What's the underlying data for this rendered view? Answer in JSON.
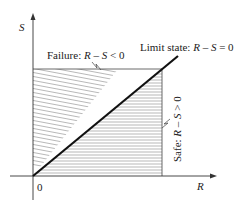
{
  "diagram": {
    "axes": {
      "y_label": "S",
      "x_label": "R",
      "origin_label": "0"
    },
    "regions": {
      "failure": {
        "prefix": "Failure: ",
        "expr_r": "R",
        "expr_rest": " – ",
        "expr_s": "S",
        "expr_tail": " < 0"
      },
      "safe": {
        "prefix": "Safe: ",
        "expr_r": "R",
        "expr_rest": " – ",
        "expr_s": "S",
        "expr_tail": " > 0"
      }
    },
    "limit_state": {
      "prefix": "Limit state: ",
      "expr_r": "R",
      "expr_rest": " – ",
      "expr_s": "S",
      "expr_tail": " = 0"
    },
    "colors": {
      "axis": "#333333",
      "hatch": "#777777",
      "limit_line": "#111111"
    }
  }
}
